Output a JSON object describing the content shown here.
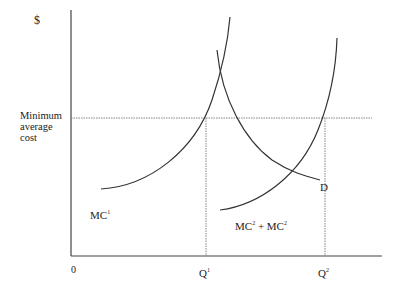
{
  "diagram": {
    "type": "economics-cost-curves",
    "y_axis_label": "$",
    "origin_label": "0",
    "reference_line_label": "Minimum average cost",
    "x_ticks": [
      {
        "name": "Q",
        "sup": "1"
      },
      {
        "name": "Q",
        "sup": "2"
      }
    ],
    "curves": [
      {
        "id": "mc1",
        "label": "MC",
        "sup": "1"
      },
      {
        "id": "demand",
        "label": "D"
      },
      {
        "id": "mc2",
        "label": "MC",
        "sup": "2",
        "plus": " + ",
        "label2": "MC",
        "sup2": "2"
      }
    ],
    "colors": {
      "line": "#333333",
      "guide": "#777777",
      "text": "#222222",
      "background": "#ffffff"
    }
  }
}
